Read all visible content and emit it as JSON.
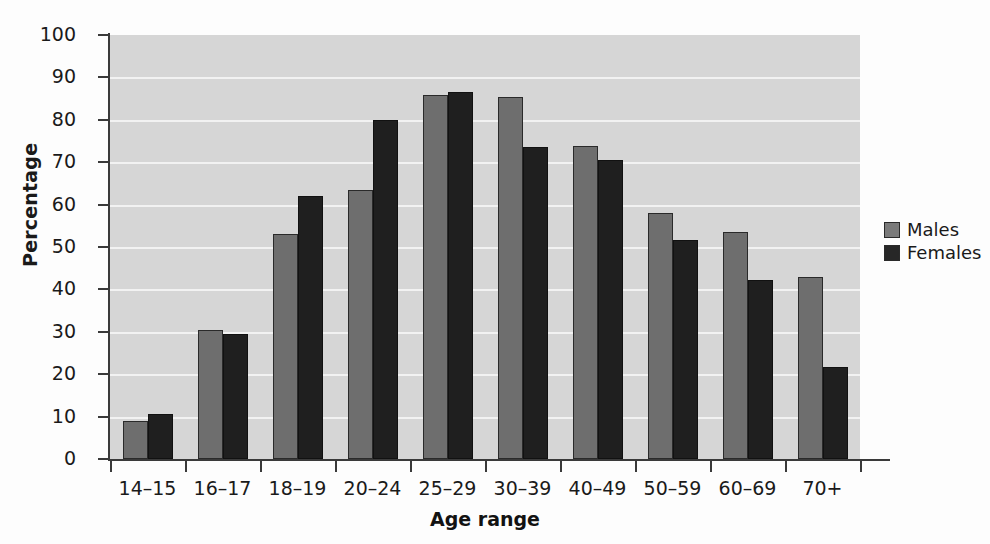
{
  "chart_data": {
    "type": "bar",
    "title": "",
    "xlabel": "Age range",
    "ylabel": "Percentage",
    "categories": [
      "14–15",
      "16–17",
      "18–19",
      "20–24",
      "25–29",
      "30–39",
      "40–49",
      "50–59",
      "60–69",
      "70+"
    ],
    "series": [
      {
        "name": "Males",
        "color": "#6e6e6e",
        "values": [
          9.0,
          30.5,
          53.0,
          63.4,
          85.8,
          85.4,
          73.9,
          58.1,
          53.5,
          43.0
        ]
      },
      {
        "name": "Females",
        "color": "#1f1f1f",
        "values": [
          10.7,
          29.5,
          62.0,
          79.9,
          86.5,
          73.7,
          70.5,
          51.6,
          42.2,
          21.7
        ]
      }
    ],
    "ylim": [
      0,
      100
    ],
    "yticks": [
      0,
      10,
      20,
      30,
      40,
      50,
      60,
      70,
      80,
      90,
      100
    ],
    "grid": true,
    "legend_position": "right",
    "plot_background": "#d6d6d6",
    "gridline_color": "#f2f2f2"
  }
}
